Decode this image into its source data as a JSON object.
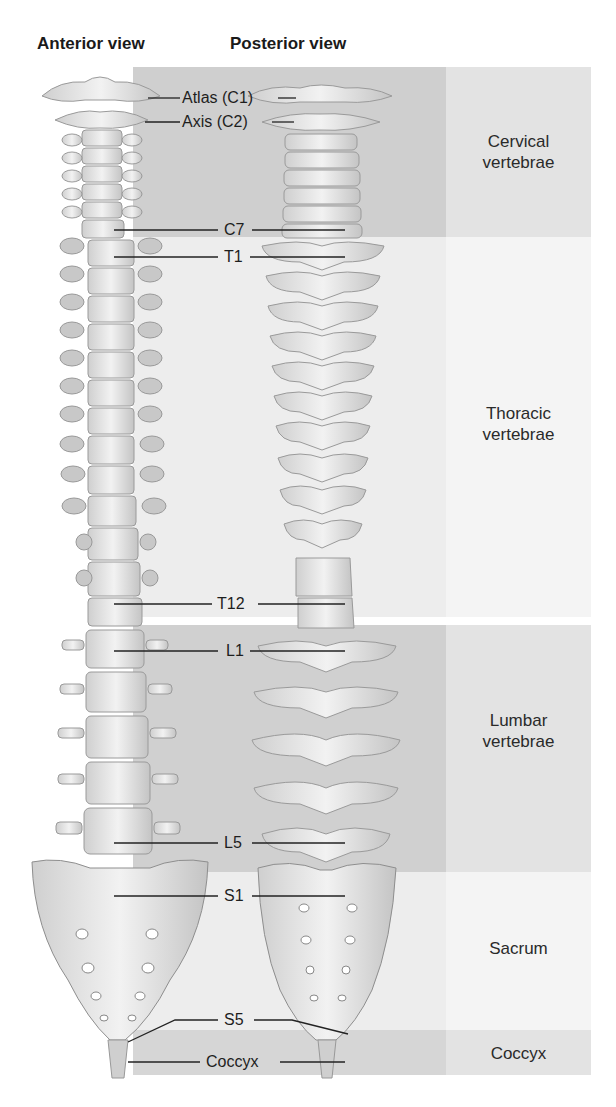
{
  "titles": {
    "anterior": "Anterior view",
    "posterior": "Posterior view"
  },
  "regions": [
    {
      "id": "cervical",
      "line1": "Cervical",
      "line2": "vertebrae",
      "top": 67,
      "bottom": 237,
      "outer": "#e3e3e3",
      "inner": "#cfcfcf"
    },
    {
      "id": "thoracic",
      "line1": "Thoracic",
      "line2": "vertebrae",
      "top": 237,
      "bottom": 617,
      "outer": "#f4f4f4",
      "inner": "#ededed"
    },
    {
      "id": "lumbar",
      "line1": "Lumbar",
      "line2": "vertebrae",
      "top": 625,
      "bottom": 872,
      "outer": "#e3e3e3",
      "inner": "#d0d0d0"
    },
    {
      "id": "sacrum",
      "line1": "Sacrum",
      "line2": "",
      "top": 872,
      "bottom": 1030,
      "outer": "#f4f4f4",
      "inner": "#ededed"
    },
    {
      "id": "coccyx",
      "line1": "Coccyx",
      "line2": "",
      "top": 1030,
      "bottom": 1075,
      "outer": "#e3e3e3",
      "inner": "#d6d6d6"
    }
  ],
  "callouts": [
    {
      "label": "Atlas (C1)",
      "y": 98
    },
    {
      "label": "Axis (C2)",
      "y": 122
    },
    {
      "label": "C7",
      "y": 230
    },
    {
      "label": "T1",
      "y": 257
    },
    {
      "label": "T12",
      "y": 604
    },
    {
      "label": "L1",
      "y": 651
    },
    {
      "label": "L5",
      "y": 843
    },
    {
      "label": "S1",
      "y": 896
    },
    {
      "label": "S5",
      "y": 1020
    },
    {
      "label": "Coccyx",
      "y": 1062
    }
  ]
}
